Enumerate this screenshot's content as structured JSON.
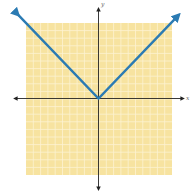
{
  "chart_data": {
    "type": "line",
    "title": "",
    "xlabel": "x",
    "ylabel": "y",
    "xlim": [
      -10,
      10
    ],
    "ylim": [
      -10,
      10
    ],
    "grid": true,
    "grid_step": 1,
    "series": [
      {
        "name": "y = |x|",
        "x": [
          -11,
          0,
          11
        ],
        "y": [
          11,
          0,
          11
        ],
        "color": "#2b7bb3",
        "arrows": true
      }
    ]
  },
  "labels": {
    "x_axis": "x",
    "y_axis": "y"
  },
  "colors": {
    "grid_fill": "#f7e3a0",
    "grid_line": "#fdf3d2",
    "axis": "#222222",
    "line": "#2b7bb3"
  }
}
